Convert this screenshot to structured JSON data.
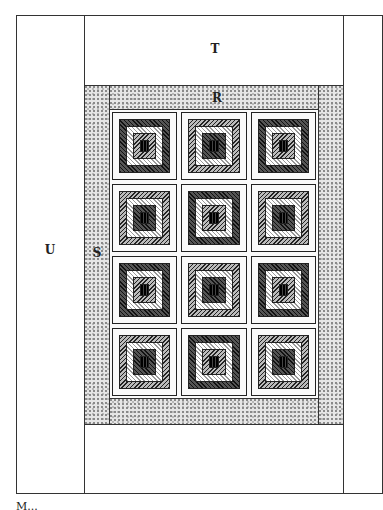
{
  "diagram": {
    "type": "quilt-layout",
    "labels": {
      "top_border": "T",
      "inner_top_border": "R",
      "inner_side_border": "S",
      "outer_side_border": "U"
    },
    "grid": {
      "rows": 4,
      "cols": 3,
      "block_style": "log-cabin"
    },
    "caption_partial": "M..."
  }
}
